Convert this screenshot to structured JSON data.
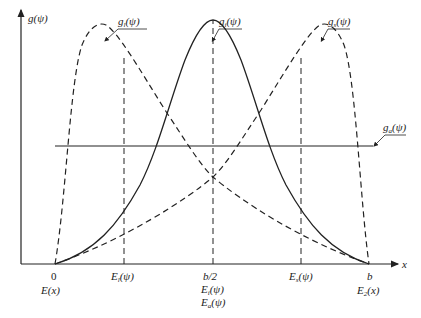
{
  "diagram": {
    "type": "membership-function-plot",
    "y_axis_label": "g(ψ)",
    "x_axis_label": "x",
    "curves": [
      {
        "id": "g_l",
        "label": "g",
        "subscript": "l",
        "arg": "(ψ)",
        "style": "dashed",
        "shape": "left-skewed peak"
      },
      {
        "id": "g_i",
        "label": "g",
        "subscript": "i",
        "arg": "(ψ)",
        "style": "solid",
        "shape": "symmetric bell centered at b/2"
      },
      {
        "id": "g_s",
        "label": "g",
        "subscript": "s",
        "arg": "(ψ)",
        "style": "dashed",
        "shape": "right-skewed peak"
      },
      {
        "id": "g_a",
        "label": "g",
        "subscript": "a",
        "arg": "(ψ)",
        "style": "solid",
        "shape": "horizontal constant"
      }
    ],
    "x_ticks": [
      {
        "id": "origin",
        "lines": [
          "0",
          "E(x)"
        ]
      },
      {
        "id": "el",
        "lines": [
          "E_l(ψ)"
        ],
        "main": "E",
        "sub": "l",
        "arg": "(ψ)"
      },
      {
        "id": "mid",
        "lines": [
          "b/2",
          "E_i(ψ)",
          "E_a(ψ)"
        ],
        "top": "b/2",
        "l2main": "E",
        "l2sub": "i",
        "l3main": "E",
        "l3sub": "a",
        "arg": "(ψ)"
      },
      {
        "id": "es",
        "lines": [
          "E_s(ψ)"
        ],
        "main": "E",
        "sub": "s",
        "arg": "(ψ)"
      },
      {
        "id": "end",
        "lines": [
          "b",
          "E_2(x)"
        ],
        "top": "b",
        "l2main": "E",
        "l2sub": "2",
        "l2arg": "(x)"
      }
    ],
    "origin_text": "0",
    "origin_sub": "E(x)",
    "b_text": "b",
    "colors": {
      "line": "#222222",
      "background": "#ffffff"
    }
  }
}
